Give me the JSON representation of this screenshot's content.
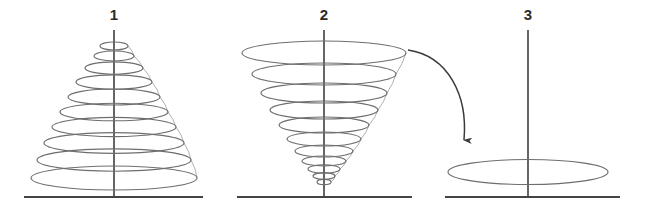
{
  "figure": {
    "title": "",
    "background_color": "#ffffff",
    "width": 645,
    "height": 210,
    "stroke_color_spiral": "#6e6e6e",
    "stroke_color_axis": "#3f3f3f",
    "stroke_color_baseline": "#444444",
    "stroke_color_arrow": "#3a3a3a"
  },
  "panels": [
    {
      "label": "1",
      "label_x": 114,
      "label_y": 20,
      "axis": {
        "x": 114,
        "y_top": 30,
        "y_bottom": 197
      },
      "baseline": {
        "x1": 24,
        "x2": 203,
        "y": 197
      },
      "shape": "expanding-conical-spiral",
      "description": "cone widening downward",
      "center_x": 114,
      "turns": [
        {
          "cy": 46,
          "rx": 14,
          "ry": 4.0
        },
        {
          "cy": 56,
          "rx": 20,
          "ry": 5.0
        },
        {
          "cy": 68,
          "rx": 29,
          "ry": 6.2
        },
        {
          "cy": 82,
          "rx": 38,
          "ry": 7.2
        },
        {
          "cy": 97,
          "rx": 46,
          "ry": 8.0
        },
        {
          "cy": 112,
          "rx": 54,
          "ry": 8.8
        },
        {
          "cy": 127,
          "rx": 62,
          "ry": 9.6
        },
        {
          "cy": 143,
          "rx": 70,
          "ry": 10.4
        },
        {
          "cy": 160,
          "rx": 77,
          "ry": 11.2
        },
        {
          "cy": 178,
          "rx": 83,
          "ry": 12.0
        }
      ]
    },
    {
      "label": "2",
      "label_x": 324,
      "label_y": 20,
      "axis": {
        "x": 324,
        "y_top": 30,
        "y_bottom": 197
      },
      "baseline": {
        "x1": 237,
        "x2": 412,
        "y": 197
      },
      "shape": "contracting-conical-spiral",
      "description": "inverted cone narrowing downward",
      "center_x": 324,
      "turns": [
        {
          "cy": 53,
          "rx": 82,
          "ry": 12.0
        },
        {
          "cy": 74,
          "rx": 72,
          "ry": 11.0
        },
        {
          "cy": 93,
          "rx": 63,
          "ry": 10.0
        },
        {
          "cy": 110,
          "rx": 54,
          "ry": 9.0
        },
        {
          "cy": 125,
          "rx": 45,
          "ry": 8.0
        },
        {
          "cy": 139,
          "rx": 37,
          "ry": 7.0
        },
        {
          "cy": 151,
          "rx": 29,
          "ry": 6.0
        },
        {
          "cy": 161,
          "rx": 22,
          "ry": 5.0
        },
        {
          "cy": 169,
          "rx": 16,
          "ry": 4.2
        },
        {
          "cy": 176,
          "rx": 11,
          "ry": 3.4
        },
        {
          "cy": 182,
          "rx": 7,
          "ry": 2.6
        }
      ]
    },
    {
      "label": "3",
      "label_x": 528,
      "label_y": 20,
      "axis": {
        "x": 528,
        "y_top": 30,
        "y_bottom": 197
      },
      "baseline": {
        "x1": 445,
        "x2": 620,
        "y": 197
      },
      "shape": "single-flat-ellipse",
      "description": "single flattened circle at the base",
      "center_x": 528,
      "turns": [
        {
          "cy": 172,
          "rx": 80,
          "ry": 12.5
        }
      ]
    }
  ],
  "arrow": {
    "name": "transition-arrow",
    "description": "curved arrow from panel 2 to panel 3",
    "path": "M 408 50 C 448 56, 468 95, 464 140",
    "head_x": 464,
    "head_y": 150
  }
}
